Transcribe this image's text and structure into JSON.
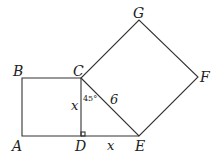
{
  "diagram": {
    "points": {
      "A": {
        "label": "A",
        "x": 22,
        "y": 136
      },
      "B": {
        "label": "B",
        "x": 22,
        "y": 78
      },
      "C": {
        "label": "C",
        "x": 81,
        "y": 78
      },
      "D": {
        "label": "D",
        "x": 81,
        "y": 136
      },
      "E": {
        "label": "E",
        "x": 139,
        "y": 136
      },
      "F": {
        "label": "F",
        "x": 198,
        "y": 77
      },
      "G": {
        "label": "G",
        "x": 139,
        "y": 20
      }
    },
    "labels": {
      "A": "A",
      "B": "B",
      "C": "C",
      "D": "D",
      "E": "E",
      "F": "F",
      "G": "G",
      "side_CD": "x",
      "side_DE": "x",
      "side_CE": "6",
      "angle_DCE": "45°"
    },
    "shapes": [
      {
        "name": "square-ABCD",
        "vertices": [
          "A",
          "B",
          "C",
          "D"
        ]
      },
      {
        "name": "square-CEFG",
        "vertices": [
          "C",
          "E",
          "F",
          "G"
        ]
      }
    ],
    "right_angle_at": "D"
  }
}
